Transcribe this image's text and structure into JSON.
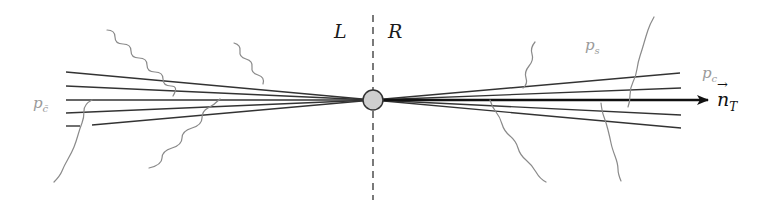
{
  "diagram": {
    "colors": {
      "line": "#333333",
      "wavy": "#8a8a8a",
      "axis": "#111111",
      "vertex_fill": "#cfcfcf",
      "vertex_stroke": "#333333",
      "divider": "#333333",
      "muted_label": "#9a9a9a"
    },
    "hemispheres": {
      "left": "L",
      "right": "R"
    },
    "labels": {
      "anticollinear_momentum": {
        "base": "p",
        "sub": "c̄"
      },
      "soft_momentum": {
        "base": "p",
        "sub": "s"
      },
      "collinear_momentum": {
        "base": "p",
        "sub": "c"
      },
      "thrust_axis": {
        "base": "n",
        "sub": "T"
      }
    },
    "vertex": {
      "cx": 373,
      "cy": 100,
      "r": 10
    },
    "divider": {
      "x": 373,
      "y1": 15,
      "y2": 200
    },
    "left_jet_lines": [
      {
        "x1": 66,
        "y1": 72,
        "x2": 373,
        "y2": 100
      },
      {
        "x1": 66,
        "y1": 86,
        "x2": 373,
        "y2": 100
      },
      {
        "x1": 66,
        "y1": 100,
        "x2": 373,
        "y2": 100
      },
      {
        "x1": 66,
        "y1": 113,
        "x2": 373,
        "y2": 100
      },
      {
        "x1": 92,
        "y1": 125,
        "x2": 373,
        "y2": 100
      }
    ],
    "left_jet_stub": {
      "x1": 66,
      "y1": 126,
      "x2": 80,
      "y2": 126
    },
    "right_jet_lines": [
      {
        "x1": 373,
        "y1": 100,
        "x2": 680,
        "y2": 73
      },
      {
        "x1": 373,
        "y1": 100,
        "x2": 681,
        "y2": 88
      },
      {
        "x1": 373,
        "y1": 100,
        "x2": 681,
        "y2": 115
      },
      {
        "x1": 373,
        "y1": 100,
        "x2": 681,
        "y2": 128
      }
    ],
    "thrust_arrow": {
      "x1": 373,
      "y1": 100,
      "x2": 708,
      "y2": 100
    }
  }
}
